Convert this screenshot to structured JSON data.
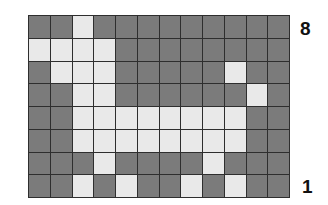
{
  "figure": {
    "rows": 8,
    "cols": 12,
    "colors": {
      "filled": "#e9e9e9",
      "empty": "#7b7b7b",
      "gridline": "#2e2e2e"
    },
    "row_labels": {
      "top": "8",
      "bottom": "1"
    },
    "grid": [
      [
        0,
        0,
        1,
        0,
        0,
        0,
        0,
        0,
        0,
        0,
        0,
        0
      ],
      [
        1,
        1,
        1,
        1,
        0,
        0,
        0,
        0,
        0,
        0,
        0,
        0
      ],
      [
        0,
        1,
        1,
        1,
        0,
        0,
        0,
        0,
        0,
        1,
        0,
        0
      ],
      [
        0,
        0,
        1,
        1,
        0,
        0,
        0,
        0,
        0,
        0,
        1,
        0
      ],
      [
        0,
        0,
        1,
        1,
        1,
        1,
        1,
        1,
        1,
        1,
        0,
        0
      ],
      [
        0,
        0,
        1,
        1,
        1,
        1,
        1,
        1,
        1,
        1,
        0,
        0
      ],
      [
        0,
        0,
        0,
        1,
        0,
        0,
        0,
        0,
        1,
        0,
        0,
        0
      ],
      [
        0,
        0,
        1,
        0,
        1,
        0,
        0,
        1,
        0,
        1,
        0,
        0
      ]
    ]
  }
}
